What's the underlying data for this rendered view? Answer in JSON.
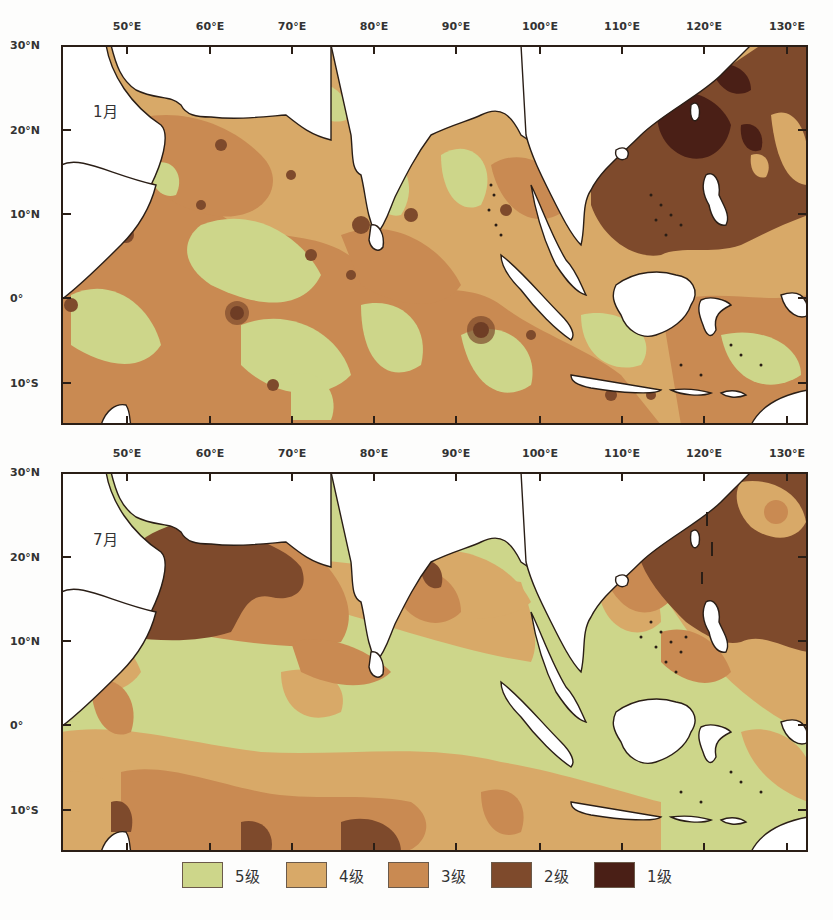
{
  "figure": {
    "type": "choropleth-map",
    "region": "North Indian Ocean and Western Pacific / Southeast Asian seas"
  },
  "axes": {
    "longitude_ticks": [
      {
        "label": "50°E",
        "x": 127
      },
      {
        "label": "60°E",
        "x": 210
      },
      {
        "label": "70°E",
        "x": 292
      },
      {
        "label": "80°E",
        "x": 374
      },
      {
        "label": "90°E",
        "x": 456
      },
      {
        "label": "100°E",
        "x": 540
      },
      {
        "label": "110°E",
        "x": 622
      },
      {
        "label": "120°E",
        "x": 704
      },
      {
        "label": "130°E",
        "x": 787
      }
    ],
    "latitude_ticks": [
      {
        "label": "30°N",
        "offset": 0
      },
      {
        "label": "20°N",
        "offset": 85
      },
      {
        "label": "10°N",
        "offset": 169
      },
      {
        "label": "0°",
        "offset": 253
      },
      {
        "label": "10°S",
        "offset": 338
      }
    ]
  },
  "panels": [
    {
      "id": "jan",
      "month_label": "1月",
      "top": 45
    },
    {
      "id": "jul",
      "month_label": "7月",
      "top": 472
    }
  ],
  "legend": {
    "items": [
      {
        "label": "5级",
        "color": "#cdd68a"
      },
      {
        "label": "4级",
        "color": "#d8a968"
      },
      {
        "label": "3级",
        "color": "#c98a52"
      },
      {
        "label": "2级",
        "color": "#7e4a2c"
      },
      {
        "label": "1级",
        "color": "#4a1f16"
      }
    ]
  },
  "colors": {
    "level5": "#cdd68a",
    "level4": "#d8a968",
    "level3": "#c98a52",
    "level2": "#7e4a2c",
    "level1": "#4a1f16",
    "land": "#ffffff",
    "coast": "#2a1e16"
  },
  "chart_data": {
    "type": "heatmap",
    "title": "",
    "xlabel": "Longitude",
    "ylabel": "Latitude",
    "xlim": [
      "45°E",
      "133°E"
    ],
    "ylim": [
      "15°S",
      "30°N"
    ],
    "x_ticks": [
      "50°E",
      "60°E",
      "70°E",
      "80°E",
      "90°E",
      "100°E",
      "110°E",
      "120°E",
      "130°E"
    ],
    "y_ticks": [
      "30°N",
      "20°N",
      "10°N",
      "0°",
      "10°S"
    ],
    "legend": [
      "5级",
      "4级",
      "3级",
      "2级",
      "1级"
    ],
    "panels": [
      {
        "label": "1月",
        "summary": "Mostly level 3-5 across Arabian Sea, Bay of Bengal and equatorial Indian Ocean with scattered level 2 spots; South China Sea and NW Pacific dominated by level 2 with level 1 patches near Taiwan Strait/Luzon Strait."
      },
      {
        "label": "7月",
        "summary": "Large level 2 region over northern/central Arabian Sea; level 2 across NW Pacific east of Philippines; Bay of Bengal mostly level 3-4; equatorial/southern Indian Ocean and Indonesian seas mostly level 5 with level 3-4 patches."
      }
    ]
  }
}
